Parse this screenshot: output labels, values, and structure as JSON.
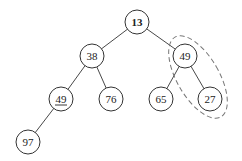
{
  "diagram": {
    "type": "binary-tree",
    "nodes": [
      {
        "id": "n13",
        "label": "13",
        "x": 137,
        "y": 22,
        "underline": false,
        "bold": true
      },
      {
        "id": "n38",
        "label": "38",
        "x": 92,
        "y": 56,
        "underline": false
      },
      {
        "id": "n49r",
        "label": "49",
        "x": 185,
        "y": 56,
        "underline": false
      },
      {
        "id": "n49l",
        "label": "49",
        "x": 61,
        "y": 99,
        "underline": true
      },
      {
        "id": "n76",
        "label": "76",
        "x": 111,
        "y": 99,
        "underline": false
      },
      {
        "id": "n65",
        "label": "65",
        "x": 161,
        "y": 99,
        "underline": false
      },
      {
        "id": "n27",
        "label": "27",
        "x": 210,
        "y": 99,
        "underline": false
      },
      {
        "id": "n97",
        "label": "97",
        "x": 28,
        "y": 142,
        "underline": false
      }
    ],
    "edges": [
      [
        "n13",
        "n38"
      ],
      [
        "n13",
        "n49r"
      ],
      [
        "n38",
        "n49l"
      ],
      [
        "n38",
        "n76"
      ],
      [
        "n49r",
        "n65"
      ],
      [
        "n49r",
        "n27"
      ],
      [
        "n49l",
        "n97"
      ]
    ],
    "highlight": {
      "shape": "dashed-ellipse",
      "encloses": [
        "n49r",
        "n27"
      ]
    }
  }
}
